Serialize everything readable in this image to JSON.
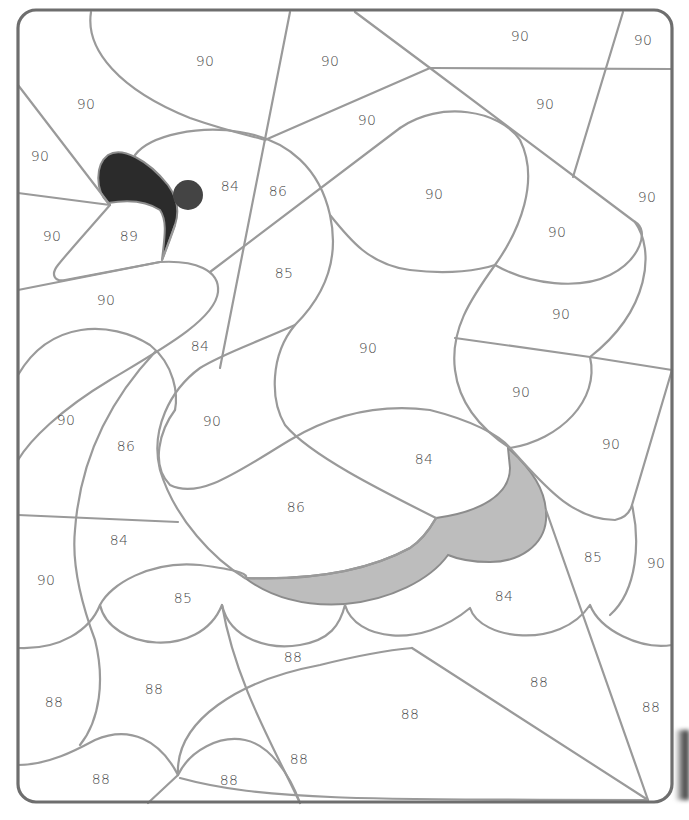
{
  "page": {
    "colors": {
      "line": "#9a9a9a",
      "frame": "#6e6e6e",
      "beak_dark": "#2b2b2b",
      "eye": "#444444",
      "wing_shadow": "#bdbdbd",
      "label": "#4a4a4a",
      "background": "#ffffff"
    }
  },
  "filled_regions": {
    "beak": {
      "fill": "#2b2b2b"
    },
    "eye": {
      "fill": "#444444"
    },
    "wing_shadow": {
      "fill": "#bdbdbd"
    }
  },
  "labels": [
    {
      "id": "l1",
      "text": "90",
      "x": 205,
      "y": 62
    },
    {
      "id": "l2",
      "text": "90",
      "x": 330,
      "y": 62
    },
    {
      "id": "l3",
      "text": "90",
      "x": 520,
      "y": 37
    },
    {
      "id": "l4",
      "text": "90",
      "x": 643,
      "y": 41
    },
    {
      "id": "l5",
      "text": "90",
      "x": 86,
      "y": 105
    },
    {
      "id": "l6",
      "text": "90",
      "x": 367,
      "y": 121
    },
    {
      "id": "l7",
      "text": "90",
      "x": 545,
      "y": 105
    },
    {
      "id": "l8",
      "text": "90",
      "x": 40,
      "y": 157
    },
    {
      "id": "l9",
      "text": "84",
      "x": 230,
      "y": 187
    },
    {
      "id": "l10",
      "text": "86",
      "x": 278,
      "y": 192
    },
    {
      "id": "l11",
      "text": "90",
      "x": 434,
      "y": 195
    },
    {
      "id": "l12",
      "text": "90",
      "x": 647,
      "y": 198
    },
    {
      "id": "l13",
      "text": "90",
      "x": 52,
      "y": 237
    },
    {
      "id": "l14",
      "text": "89",
      "x": 129,
      "y": 237
    },
    {
      "id": "l15",
      "text": "90",
      "x": 557,
      "y": 233
    },
    {
      "id": "l16",
      "text": "85",
      "x": 284,
      "y": 274
    },
    {
      "id": "l17",
      "text": "90",
      "x": 106,
      "y": 301
    },
    {
      "id": "l18",
      "text": "90",
      "x": 561,
      "y": 315
    },
    {
      "id": "l19",
      "text": "84",
      "x": 200,
      "y": 347
    },
    {
      "id": "l20",
      "text": "90",
      "x": 368,
      "y": 349
    },
    {
      "id": "l21",
      "text": "90",
      "x": 521,
      "y": 393
    },
    {
      "id": "l22",
      "text": "90",
      "x": 66,
      "y": 421
    },
    {
      "id": "l23",
      "text": "90",
      "x": 212,
      "y": 422
    },
    {
      "id": "l24",
      "text": "86",
      "x": 126,
      "y": 447
    },
    {
      "id": "l25",
      "text": "90",
      "x": 611,
      "y": 445
    },
    {
      "id": "l26",
      "text": "84",
      "x": 424,
      "y": 460
    },
    {
      "id": "l27",
      "text": "86",
      "x": 296,
      "y": 508
    },
    {
      "id": "l28",
      "text": "84",
      "x": 119,
      "y": 541
    },
    {
      "id": "l29",
      "text": "85",
      "x": 593,
      "y": 558
    },
    {
      "id": "l30",
      "text": "90",
      "x": 656,
      "y": 564
    },
    {
      "id": "l31",
      "text": "90",
      "x": 46,
      "y": 581
    },
    {
      "id": "l32",
      "text": "85",
      "x": 183,
      "y": 599
    },
    {
      "id": "l33",
      "text": "84",
      "x": 504,
      "y": 597
    },
    {
      "id": "l34",
      "text": "88",
      "x": 293,
      "y": 658
    },
    {
      "id": "l35",
      "text": "88",
      "x": 539,
      "y": 683
    },
    {
      "id": "l36",
      "text": "88",
      "x": 154,
      "y": 690
    },
    {
      "id": "l37",
      "text": "88",
      "x": 54,
      "y": 703
    },
    {
      "id": "l38",
      "text": "88",
      "x": 651,
      "y": 708
    },
    {
      "id": "l39",
      "text": "88",
      "x": 410,
      "y": 715
    },
    {
      "id": "l40",
      "text": "88",
      "x": 299,
      "y": 760
    },
    {
      "id": "l41",
      "text": "88",
      "x": 101,
      "y": 780
    },
    {
      "id": "l42",
      "text": "88",
      "x": 229,
      "y": 781
    }
  ]
}
